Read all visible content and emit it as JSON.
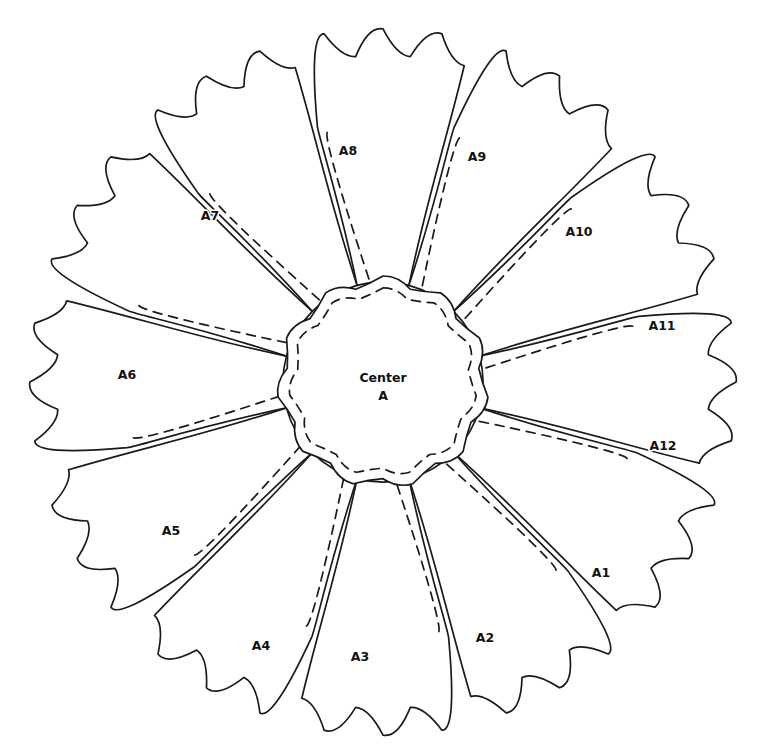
{
  "document": {
    "title": "Flower Applique Pattern Template",
    "background_color": "#ffffff",
    "line_color": "#1a1a1a",
    "label_color": "#111111",
    "width": 781,
    "height": 749
  },
  "center": {
    "name": "center-piece",
    "line1": "Center",
    "line2": "A",
    "label_x": 383,
    "label_y": 382,
    "cx": 383,
    "cy": 382,
    "radius": 100,
    "seam_inset": 11,
    "scallop_count": 11,
    "scallop_depth": 6
  },
  "petals": [
    {
      "id": "A1",
      "label": "A1",
      "label_x": 601,
      "label_y": 573,
      "angle_deg": 30,
      "order": 1
    },
    {
      "id": "A2",
      "label": "A2",
      "label_x": 485,
      "label_y": 638,
      "angle_deg": 60,
      "order": 2
    },
    {
      "id": "A3",
      "label": "A3",
      "label_x": 360,
      "label_y": 657,
      "angle_deg": 90,
      "order": 3
    },
    {
      "id": "A4",
      "label": "A4",
      "label_x": 261,
      "label_y": 646,
      "angle_deg": 120,
      "order": 4
    },
    {
      "id": "A5",
      "label": "A5",
      "label_x": 171,
      "label_y": 531,
      "angle_deg": 150,
      "order": 5
    },
    {
      "id": "A6",
      "label": "A6",
      "label_x": 127,
      "label_y": 375,
      "angle_deg": 180,
      "order": 6
    },
    {
      "id": "A7",
      "label": "A7",
      "label_x": 210,
      "label_y": 216,
      "angle_deg": 210,
      "order": 7
    },
    {
      "id": "A8",
      "label": "A8",
      "label_x": 348,
      "label_y": 151,
      "angle_deg": 240,
      "order": 8
    },
    {
      "id": "A9",
      "label": "A9",
      "label_x": 477,
      "label_y": 157,
      "angle_deg": 270,
      "order": 9
    },
    {
      "id": "A10",
      "label": "A10",
      "label_x": 579,
      "label_y": 232,
      "angle_deg": 300,
      "order": 10
    },
    {
      "id": "A11",
      "label": "A11",
      "label_x": 662,
      "label_y": 326,
      "angle_deg": 330,
      "order": 11
    },
    {
      "id": "A12",
      "label": "A12",
      "label_x": 663,
      "label_y": 446,
      "angle_deg": 0,
      "order": 12
    }
  ],
  "geometry": {
    "petal_count": 12,
    "petal_inner_radius": 100,
    "petal_outer_radius": 330,
    "petal_half_angle_deg": 15,
    "seam_allowance_px": 9,
    "dash_pattern": "9 7",
    "stroke_width": 1.7,
    "edge_wave_amplitude": 10,
    "edge_wave_count": 3
  }
}
